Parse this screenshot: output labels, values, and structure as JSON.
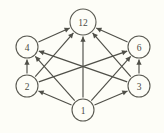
{
  "diagram": {
    "background_color": "#fdfdf7",
    "stroke_color": "#4f4f48",
    "node_fill": "#fdfdf7",
    "nodes": [
      {
        "id": "n12",
        "label": "12",
        "cx": 83,
        "cy": 22,
        "r": 13
      },
      {
        "id": "n4",
        "label": "4",
        "cx": 27,
        "cy": 47,
        "r": 11
      },
      {
        "id": "n6",
        "label": "6",
        "cx": 139,
        "cy": 47,
        "r": 11
      },
      {
        "id": "n2",
        "label": "2",
        "cx": 27,
        "cy": 86,
        "r": 11
      },
      {
        "id": "n3",
        "label": "3",
        "cx": 139,
        "cy": 86,
        "r": 11
      },
      {
        "id": "n1",
        "label": "1",
        "cx": 83,
        "cy": 110,
        "r": 11
      }
    ],
    "edges": [
      {
        "from": "n4",
        "to": "n12",
        "label": "4-to-12"
      },
      {
        "from": "n6",
        "to": "n12",
        "label": "6-to-12"
      },
      {
        "from": "n2",
        "to": "n12",
        "label": "2-to-12"
      },
      {
        "from": "n3",
        "to": "n12",
        "label": "3-to-12"
      },
      {
        "from": "n1",
        "to": "n12",
        "label": "1-to-12"
      },
      {
        "from": "n2",
        "to": "n4",
        "label": "2-to-4"
      },
      {
        "from": "n3",
        "to": "n6",
        "label": "3-to-6"
      },
      {
        "from": "n2",
        "to": "n6",
        "label": "2-to-6"
      },
      {
        "from": "n3",
        "to": "n4",
        "label": "3-to-4"
      },
      {
        "from": "n1",
        "to": "n2",
        "label": "1-to-2"
      },
      {
        "from": "n1",
        "to": "n3",
        "label": "1-to-3"
      },
      {
        "from": "n1",
        "to": "n4",
        "label": "1-to-4"
      },
      {
        "from": "n1",
        "to": "n6",
        "label": "1-to-6"
      }
    ]
  },
  "chart_data": {
    "type": "diagram",
    "nodes": [
      "1",
      "2",
      "3",
      "4",
      "6",
      "12"
    ],
    "directed": true,
    "edges": [
      [
        "1",
        "2"
      ],
      [
        "1",
        "3"
      ],
      [
        "1",
        "4"
      ],
      [
        "1",
        "6"
      ],
      [
        "1",
        "12"
      ],
      [
        "2",
        "4"
      ],
      [
        "2",
        "6"
      ],
      [
        "2",
        "12"
      ],
      [
        "3",
        "4"
      ],
      [
        "3",
        "6"
      ],
      [
        "3",
        "12"
      ],
      [
        "4",
        "12"
      ],
      [
        "6",
        "12"
      ]
    ]
  }
}
